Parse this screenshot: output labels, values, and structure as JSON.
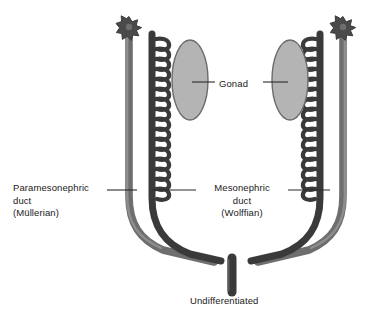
{
  "figure": {
    "background_color": "#ffffff",
    "title_caption": "Undifferentiated",
    "labels": {
      "gonad": "Gonad",
      "paramesonephric_line1": "Paramesonephric",
      "paramesonephric_line2": "duct",
      "paramesonephric_line3": "(Müllerian)",
      "mesonephric_line1": "Mesonephric",
      "mesonephric_line2": "duct",
      "mesonephric_line3": "(Wolffian)",
      "undifferentiated": "Undifferentiated"
    },
    "colors": {
      "gonad_fill": "#b4b4b4",
      "gonad_stroke": "#6b6b6b",
      "paramesonephric_duct": "#6e6e6e",
      "paramesonephric_duct_shade": "#8c8c8c",
      "mesonephric_duct": "#3a3a3a",
      "tubule": "#3a3a3a",
      "fimbria_star": "#4a4a4a",
      "leader_line": "#2b2b2b",
      "text": "#1a1a1a"
    },
    "structures": [
      {
        "name": "paramesonephric-duct-left",
        "kind": "duct",
        "side": "left",
        "shade": "light",
        "has_fimbriated_tip": true
      },
      {
        "name": "paramesonephric-duct-right",
        "kind": "duct",
        "side": "right",
        "shade": "light",
        "has_fimbriated_tip": true
      },
      {
        "name": "mesonephric-duct-left",
        "kind": "duct",
        "side": "left",
        "shade": "dark",
        "tubule_count": 16
      },
      {
        "name": "mesonephric-duct-right",
        "kind": "duct",
        "side": "right",
        "shade": "dark",
        "tubule_count": 16
      },
      {
        "name": "gonad-left",
        "kind": "oval",
        "side": "left"
      },
      {
        "name": "gonad-right",
        "kind": "oval",
        "side": "right"
      },
      {
        "name": "urogenital-sinus-trunk",
        "kind": "trunk",
        "side": "center"
      }
    ],
    "leader_lines": [
      {
        "name": "gonad-leader-left",
        "x1": 215,
        "y1": 82,
        "x2": 192,
        "y2": 82
      },
      {
        "name": "gonad-leader-right",
        "x1": 263,
        "y1": 82,
        "x2": 288,
        "y2": 82
      },
      {
        "name": "paramesonephric-leader",
        "x1": 107,
        "y1": 190,
        "x2": 137,
        "y2": 190
      },
      {
        "name": "mesonephric-leader-left",
        "x1": 196,
        "y1": 190,
        "x2": 152,
        "y2": 190
      },
      {
        "name": "mesonephric-leader-right",
        "x1": 288,
        "y1": 190,
        "x2": 330,
        "y2": 190
      }
    ]
  }
}
